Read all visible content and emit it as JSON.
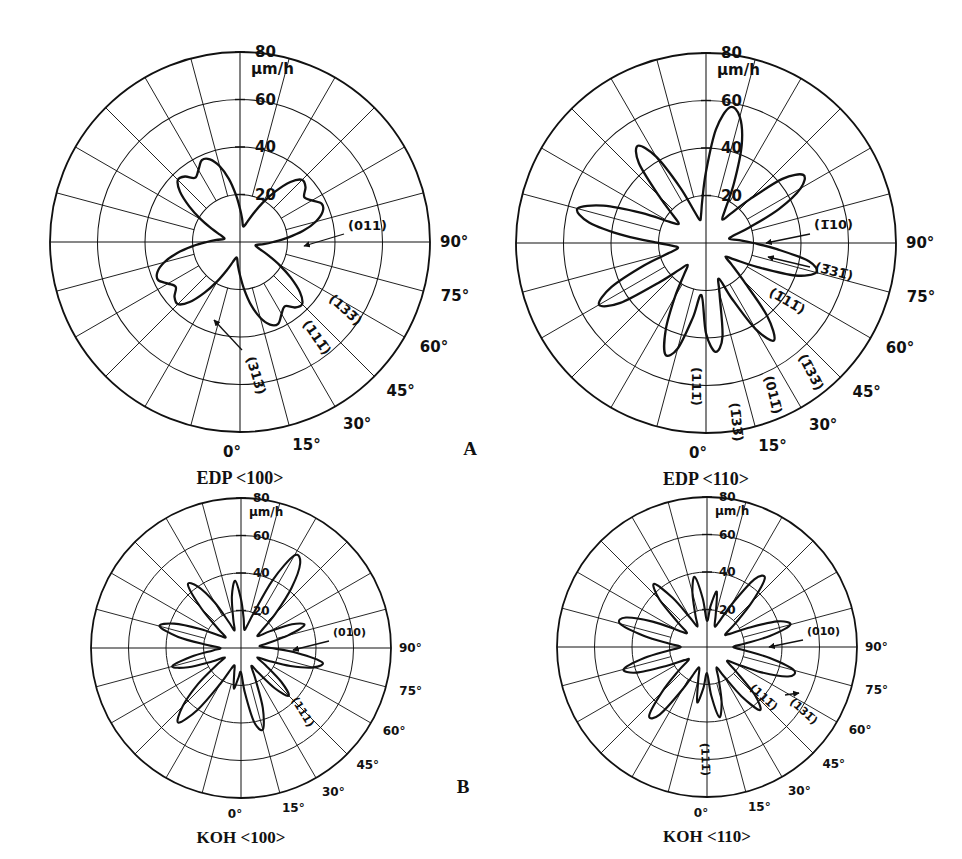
{
  "figure": {
    "panels": [
      {
        "id": "edp-100",
        "letter": "A",
        "caption": "EDP <100>",
        "caption_prefix": "EDP",
        "caption_suffix": "<100>",
        "unit_label": "µm/h",
        "radial_ticks": [
          "20",
          "40",
          "60",
          "80"
        ],
        "radial_values": [
          20,
          40,
          60,
          80
        ],
        "angle_ticks": [
          "0°",
          "15°",
          "30°",
          "45°",
          "60°",
          "75°",
          "90°"
        ],
        "angle_values": [
          0,
          15,
          30,
          45,
          60,
          75,
          90
        ],
        "plane_labels": [
          "(011)",
          "(133̅)",
          "(111̅)",
          "(313̅)"
        ],
        "center": {
          "x": 240,
          "y": 242
        },
        "radius": 190
      },
      {
        "id": "edp-110",
        "letter": "A",
        "caption": "EDP <110>",
        "caption_prefix": "EDP",
        "caption_suffix": "<110>",
        "unit_label": "µm/h",
        "radial_ticks": [
          "20",
          "40",
          "60",
          "80"
        ],
        "radial_values": [
          20,
          40,
          60,
          80
        ],
        "angle_ticks": [
          "0°",
          "15°",
          "30°",
          "45°",
          "60°",
          "75°",
          "90°"
        ],
        "angle_values": [
          0,
          15,
          30,
          45,
          60,
          75,
          90
        ],
        "plane_labels": [
          "(1̅10)",
          "(3̅31̅)",
          "(1̅11̅)",
          "(1̅33̅)",
          "(011̅)",
          "(111̅)",
          "(1̅33̅)"
        ],
        "center": {
          "x": 706,
          "y": 243
        },
        "radius": 190
      },
      {
        "id": "koh-100",
        "letter": "B",
        "caption": "KOH <100>",
        "caption_prefix": "KOH",
        "caption_suffix": "<100>",
        "unit_label": "µm/h",
        "radial_ticks": [
          "20",
          "40",
          "60",
          "80"
        ],
        "radial_values": [
          20,
          40,
          60,
          80
        ],
        "angle_ticks": [
          "0°",
          "15°",
          "30°",
          "45°",
          "60°",
          "75°",
          "90°"
        ],
        "angle_values": [
          0,
          15,
          30,
          45,
          60,
          75,
          90
        ],
        "plane_labels": [
          "(010)",
          "(111)"
        ],
        "center": {
          "x": 241,
          "y": 648
        },
        "radius": 150
      },
      {
        "id": "koh-110",
        "letter": "B",
        "caption": "KOH <110>",
        "caption_prefix": "KOH",
        "caption_suffix": "<110>",
        "unit_label": "µm/h",
        "radial_ticks": [
          "20",
          "40",
          "60",
          "80"
        ],
        "radial_values": [
          20,
          40,
          60,
          80
        ],
        "angle_ticks": [
          "0°",
          "15°",
          "30°",
          "45°",
          "60°",
          "75°",
          "90°"
        ],
        "angle_values": [
          0,
          15,
          30,
          45,
          60,
          75,
          90
        ],
        "plane_labels": [
          "(010)",
          "(111̅)",
          "(131̅)",
          "(111̅)"
        ],
        "center": {
          "x": 707,
          "y": 647
        },
        "radius": 150
      }
    ],
    "group_labels": [
      {
        "text": "A",
        "x": 470,
        "y": 455
      },
      {
        "text": "B",
        "x": 463,
        "y": 793
      }
    ],
    "colors": {
      "ink": "#111111",
      "grid": "#222222",
      "background": "#ffffff"
    }
  },
  "chart_data": {
    "type": "line",
    "subtype": "polar",
    "ylabel": "µm/h",
    "rlim": [
      0,
      80
    ],
    "rticks": [
      20,
      40,
      60,
      80
    ],
    "theta_ticks_deg": [
      0,
      15,
      30,
      45,
      60,
      75,
      90
    ],
    "grid": true,
    "legend": "none",
    "charts": [
      {
        "name": "EDP <100>",
        "panel": "A",
        "comment": "Four-fold flower; lobes peaking near 38 um/h at 90-deg steps with twin-peak tips",
        "theta_deg": [
          0,
          5,
          10,
          15,
          20,
          25,
          30,
          35,
          40,
          45,
          50,
          55,
          60,
          65,
          70,
          75,
          80,
          85,
          90,
          95,
          100,
          105,
          110,
          115,
          120,
          125,
          130,
          135,
          140,
          145,
          150,
          155,
          160,
          165,
          170,
          175,
          180,
          185,
          190,
          195,
          200,
          205,
          210,
          215,
          220,
          225,
          230,
          235,
          240,
          245,
          250,
          255,
          260,
          265,
          270,
          275,
          280,
          285,
          290,
          295,
          300,
          305,
          310,
          315,
          320,
          325,
          330,
          335,
          340,
          345,
          350,
          355
        ],
        "r": [
          14,
          20,
          27,
          33,
          37,
          38,
          35,
          33,
          36,
          37,
          33,
          26,
          19,
          13,
          9,
          7,
          7,
          10,
          14,
          20,
          27,
          33,
          37,
          38,
          35,
          33,
          36,
          37,
          33,
          26,
          19,
          13,
          9,
          7,
          7,
          10,
          14,
          20,
          27,
          33,
          37,
          38,
          35,
          33,
          36,
          37,
          33,
          26,
          19,
          13,
          9,
          7,
          7,
          10,
          14,
          20,
          27,
          33,
          37,
          38,
          35,
          33,
          36,
          37,
          33,
          26,
          19,
          13,
          9,
          7,
          7,
          10
        ]
      },
      {
        "name": "EDP <110>",
        "panel": "A",
        "comment": "Eight narrow lobes; vertical pair reaching ~58 um/h, horizontal pair ~45 um/h with notched tips",
        "theta_deg": [
          0,
          5,
          10,
          15,
          20,
          25,
          30,
          35,
          40,
          45,
          50,
          55,
          60,
          65,
          70,
          75,
          80,
          85,
          90,
          95,
          100,
          105,
          110,
          115,
          120,
          125,
          130,
          135,
          140,
          145,
          150,
          155,
          160,
          165,
          170,
          175,
          180,
          185,
          190,
          195,
          200,
          205,
          210,
          215,
          220,
          225,
          230,
          235,
          240,
          245,
          250,
          255,
          260,
          265,
          270,
          275,
          280,
          285,
          290,
          295,
          300,
          305,
          310,
          315,
          320,
          325,
          330,
          335,
          340,
          345,
          350,
          355
        ],
        "r": [
          38,
          46,
          40,
          22,
          16,
          26,
          42,
          50,
          40,
          22,
          14,
          10,
          14,
          24,
          40,
          48,
          44,
          30,
          20,
          14,
          10,
          12,
          20,
          34,
          46,
          50,
          42,
          26,
          16,
          12,
          16,
          28,
          44,
          55,
          58,
          48,
          30,
          18,
          12,
          10,
          14,
          26,
          42,
          50,
          44,
          28,
          18,
          14,
          18,
          30,
          46,
          56,
          50,
          34,
          20,
          14,
          12,
          16,
          28,
          44,
          52,
          44,
          26,
          16,
          12,
          16,
          26,
          40,
          50,
          46,
          32,
          22
        ]
      },
      {
        "name": "KOH <100>",
        "panel": "B",
        "comment": "Eight sharp needle lobes; vertical pair near 55-58 um/h, horizontal pair near 45 um/h",
        "theta_deg": [
          0,
          5,
          10,
          15,
          20,
          25,
          30,
          35,
          40,
          45,
          50,
          55,
          60,
          65,
          70,
          75,
          80,
          85,
          90,
          95,
          100,
          105,
          110,
          115,
          120,
          125,
          130,
          135,
          140,
          145,
          150,
          155,
          160,
          165,
          170,
          175,
          180,
          185,
          190,
          195,
          200,
          205,
          210,
          215,
          220,
          225,
          230,
          235,
          240,
          245,
          250,
          255,
          260,
          265,
          270,
          275,
          280,
          285,
          290,
          295,
          300,
          305,
          310,
          315,
          320,
          325,
          330,
          335,
          340,
          345,
          350,
          355
        ],
        "r": [
          13,
          24,
          40,
          45,
          34,
          18,
          11,
          16,
          28,
          36,
          28,
          16,
          10,
          16,
          28,
          40,
          44,
          30,
          16,
          10,
          14,
          26,
          36,
          30,
          18,
          11,
          14,
          26,
          42,
          55,
          57,
          40,
          20,
          12,
          10,
          16,
          26,
          36,
          28,
          16,
          10,
          15,
          28,
          40,
          44,
          30,
          16,
          10,
          13,
          24,
          38,
          45,
          34,
          18,
          11,
          15,
          27,
          38,
          30,
          17,
          10,
          16,
          30,
          44,
          52,
          40,
          22,
          12,
          10,
          14,
          22,
          16
        ]
      },
      {
        "name": "KOH <110>",
        "panel": "B",
        "comment": "Twelve-ish lobes; long horizontal lobes to ~48 um/h, inclined pair near 48 um/h",
        "theta_deg": [
          0,
          5,
          10,
          15,
          20,
          25,
          30,
          35,
          40,
          45,
          50,
          55,
          60,
          65,
          70,
          75,
          80,
          85,
          90,
          95,
          100,
          105,
          110,
          115,
          120,
          125,
          130,
          135,
          140,
          145,
          150,
          155,
          160,
          165,
          170,
          175,
          180,
          185,
          190,
          195,
          200,
          205,
          210,
          215,
          220,
          225,
          230,
          235,
          240,
          245,
          250,
          255,
          260,
          265,
          270,
          275,
          280,
          285,
          290,
          295,
          300,
          305,
          310,
          315,
          320,
          325,
          330,
          335,
          340,
          345,
          350,
          355
        ],
        "r": [
          14,
          26,
          38,
          30,
          18,
          12,
          18,
          32,
          44,
          36,
          20,
          13,
          18,
          32,
          46,
          48,
          34,
          20,
          14,
          20,
          34,
          46,
          40,
          24,
          14,
          12,
          20,
          34,
          48,
          44,
          26,
          14,
          12,
          18,
          30,
          22,
          14,
          26,
          38,
          30,
          18,
          12,
          18,
          32,
          44,
          36,
          20,
          13,
          18,
          32,
          46,
          48,
          34,
          20,
          14,
          20,
          34,
          46,
          40,
          24,
          14,
          12,
          20,
          34,
          48,
          44,
          26,
          14,
          12,
          18,
          30,
          22
        ]
      }
    ]
  }
}
